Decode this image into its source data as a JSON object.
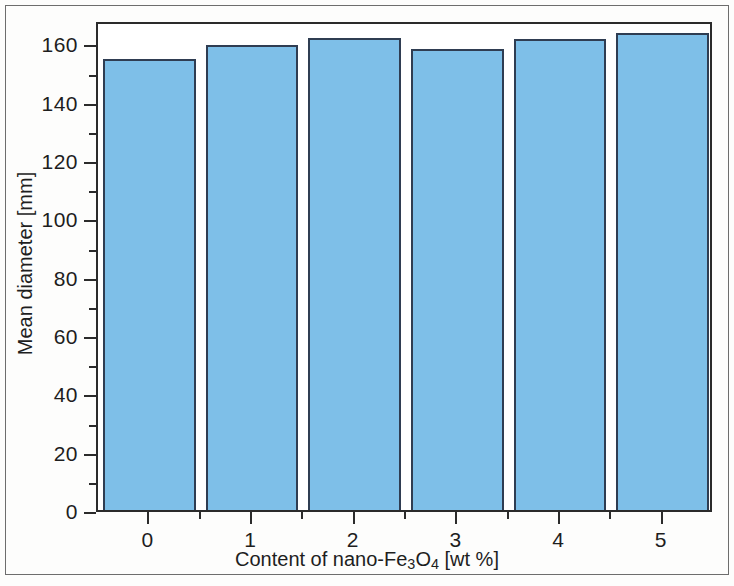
{
  "chart_data": {
    "type": "bar",
    "title": "",
    "subtitle": "",
    "xlabel_parts": {
      "pre": "Content of nano-Fe",
      "sub1": "3",
      "mid": "O",
      "sub2": "4",
      "post": " [wt %]"
    },
    "xlabel": "Content of nano-Fe3O4 [wt %]",
    "ylabel": "Mean diameter [mm]",
    "categories": [
      "0",
      "1",
      "2",
      "3",
      "4",
      "5"
    ],
    "values": [
      154.5,
      159.5,
      162.0,
      158.0,
      161.5,
      163.5
    ],
    "xlim": [
      -0.5,
      5.5
    ],
    "ylim": [
      0,
      168
    ],
    "y_major_ticks": [
      0,
      20,
      40,
      60,
      80,
      100,
      120,
      140,
      160
    ],
    "y_tick_labels": [
      "0",
      "20",
      "40",
      "60",
      "80",
      "100",
      "120",
      "140",
      "160"
    ],
    "y_minor_ticks": [
      10,
      30,
      50,
      70,
      90,
      110,
      130,
      150
    ],
    "x_major_ticks": [
      0,
      1,
      2,
      3,
      4,
      5
    ],
    "x_minor_ticks": [
      -0.5,
      0.5,
      1.5,
      2.5,
      3.5,
      4.5,
      5.5
    ],
    "grid": false,
    "legend": null,
    "series": [
      {
        "name": "Mean diameter",
        "values": [
          154.5,
          159.5,
          162.0,
          158.0,
          161.5,
          163.5
        ],
        "bar_fill_color": "#7ebfe8",
        "bar_edge_color": "#2f3d52"
      }
    ],
    "colors": {
      "bar_fill": "#7ebfe8",
      "bar_edge": "#2f3d52",
      "axis": "#2b2b2b",
      "text": "#1e1e1e",
      "frame": "#6d6d6d",
      "background": "#fdfdfc"
    }
  }
}
